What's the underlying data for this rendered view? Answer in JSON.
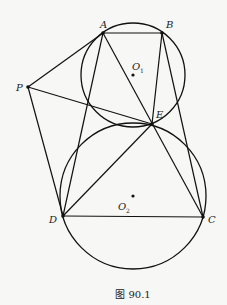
{
  "diagram": {
    "caption": "图 90.1",
    "points": {
      "A": {
        "label": "A",
        "x": 103,
        "y": 33
      },
      "B": {
        "label": "B",
        "x": 162,
        "y": 33
      },
      "P": {
        "label": "P",
        "x": 28,
        "y": 87
      },
      "E": {
        "label": "E",
        "x": 152,
        "y": 124
      },
      "D": {
        "label": "D",
        "x": 63,
        "y": 216
      },
      "C": {
        "label": "C",
        "x": 203,
        "y": 217
      }
    },
    "centers": {
      "O1": {
        "label": "O",
        "sub": "1",
        "x": 133,
        "y": 75
      },
      "O2": {
        "label": "O",
        "sub": "2",
        "x": 133,
        "y": 196
      }
    },
    "circles": [
      {
        "name": "circle-O1",
        "cx": 133,
        "cy": 75,
        "r": 52
      },
      {
        "name": "circle-O2",
        "cx": 133,
        "cy": 196,
        "r": 73
      }
    ],
    "segments": [
      "AB",
      "PA",
      "PD",
      "PE",
      "AD",
      "AC",
      "BE",
      "BC",
      "DE",
      "DC"
    ]
  }
}
